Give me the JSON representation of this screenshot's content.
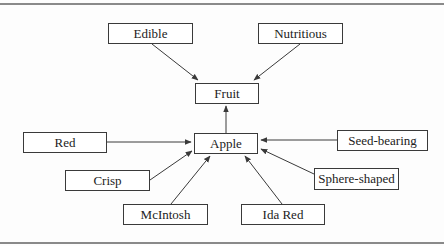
{
  "diagram": {
    "type": "concept-map",
    "colors": {
      "line": "#3a3a3a",
      "text": "#222222",
      "rule": "#8a8a8a"
    },
    "nodes": [
      {
        "id": "edible",
        "label": "Edible",
        "x": 108,
        "y": 23,
        "w": 85,
        "h": 21
      },
      {
        "id": "nutritious",
        "label": "Nutritious",
        "x": 258,
        "y": 23,
        "w": 85,
        "h": 21
      },
      {
        "id": "fruit",
        "label": "Fruit",
        "x": 195,
        "y": 83,
        "w": 64,
        "h": 21
      },
      {
        "id": "apple",
        "label": "Apple",
        "x": 194,
        "y": 133,
        "w": 64,
        "h": 21
      },
      {
        "id": "red",
        "label": "Red",
        "x": 23,
        "y": 132,
        "w": 84,
        "h": 21
      },
      {
        "id": "seed-bearing",
        "label": "Seed-bearing",
        "x": 337,
        "y": 130,
        "w": 91,
        "h": 21
      },
      {
        "id": "crisp",
        "label": "Crisp",
        "x": 65,
        "y": 170,
        "w": 85,
        "h": 21
      },
      {
        "id": "sphere-shaped",
        "label": "Sphere-shaped",
        "x": 314,
        "y": 168,
        "w": 85,
        "h": 22
      },
      {
        "id": "mcintosh",
        "label": "McIntosh",
        "x": 123,
        "y": 204,
        "w": 85,
        "h": 21
      },
      {
        "id": "ida-red",
        "label": "Ida Red",
        "x": 241,
        "y": 204,
        "w": 84,
        "h": 21
      }
    ],
    "edges": [
      {
        "from": "edible",
        "to": "fruit",
        "x1": 152,
        "y1": 44,
        "x2": 198,
        "y2": 80
      },
      {
        "from": "nutritious",
        "to": "fruit",
        "x1": 300,
        "y1": 44,
        "x2": 254,
        "y2": 80
      },
      {
        "from": "apple",
        "to": "fruit",
        "x1": 226,
        "y1": 133,
        "x2": 226,
        "y2": 106
      },
      {
        "from": "red",
        "to": "apple",
        "x1": 107,
        "y1": 142,
        "x2": 191,
        "y2": 142
      },
      {
        "from": "seed-bearing",
        "to": "apple",
        "x1": 337,
        "y1": 140,
        "x2": 261,
        "y2": 140
      },
      {
        "from": "crisp",
        "to": "apple",
        "x1": 150,
        "y1": 180,
        "x2": 192,
        "y2": 151
      },
      {
        "from": "mcintosh",
        "to": "apple",
        "x1": 171,
        "y1": 204,
        "x2": 210,
        "y2": 156
      },
      {
        "from": "ida-red",
        "to": "apple",
        "x1": 282,
        "y1": 204,
        "x2": 245,
        "y2": 156
      },
      {
        "from": "sphere-shaped",
        "to": "apple",
        "x1": 314,
        "y1": 174,
        "x2": 261,
        "y2": 149
      }
    ]
  }
}
